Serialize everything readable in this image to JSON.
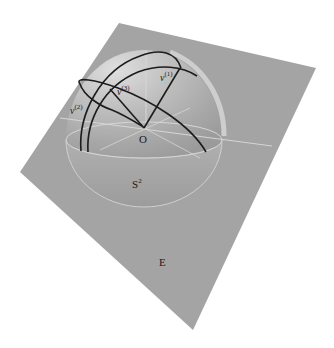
{
  "diagram": {
    "type": "3d-geometry",
    "labels": {
      "origin": "O",
      "sphere": "S",
      "sphere_sup": "2",
      "plane": "E",
      "v1_base": "v",
      "v1_sup": "(1)",
      "v2_base": "v",
      "v2_sup": "(2)",
      "v3_base": "v",
      "v3_sup": "(3)"
    },
    "colors": {
      "background": "#ffffff",
      "plane": "#a4a4a4",
      "sphere_light": "#dcdcdc",
      "sphere_mid": "#b4b4b4",
      "sphere_dark": "#9c9c9c",
      "curves": "#1c1c1c",
      "guide_lines": "#d6d6d6"
    },
    "points": {
      "O": [
        144,
        128
      ],
      "v1": [
        180,
        69
      ],
      "v2": [
        84,
        113
      ],
      "v3": [
        110,
        90
      ]
    }
  }
}
